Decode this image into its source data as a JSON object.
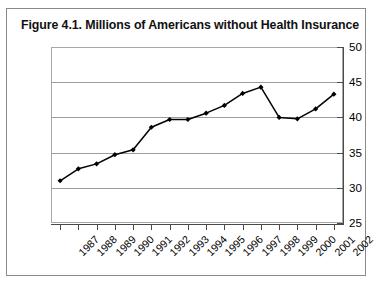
{
  "figure": {
    "title": "Figure 4.1.  Millions of Americans without Health Insurance"
  },
  "chart_data": {
    "type": "line",
    "title": "Figure 4.1.  Millions of Americans without Health Insurance",
    "xlabel": "",
    "ylabel": "",
    "categories": [
      "1987",
      "1988",
      "1989",
      "1990",
      "1991",
      "1992",
      "1993",
      "1994",
      "1995",
      "1996",
      "1997",
      "1998",
      "1999",
      "2000",
      "2001",
      "2002"
    ],
    "values": [
      31.0,
      32.7,
      33.4,
      34.7,
      35.4,
      38.6,
      39.7,
      39.7,
      40.6,
      41.7,
      43.4,
      44.3,
      40.0,
      39.8,
      41.2,
      43.3
    ],
    "ylim": [
      25,
      50
    ],
    "yticks": [
      25,
      30,
      35,
      40,
      45,
      50
    ],
    "ytick_labels": [
      "25",
      "30",
      "35",
      "40",
      "45",
      "50"
    ],
    "y_axis_position": "right",
    "grid": true,
    "grid_axis": "y",
    "legend": "none",
    "marker": "diamond",
    "line_color": "#000000",
    "grid_color": "#9d9d9d",
    "xtick_rotation": -45
  }
}
